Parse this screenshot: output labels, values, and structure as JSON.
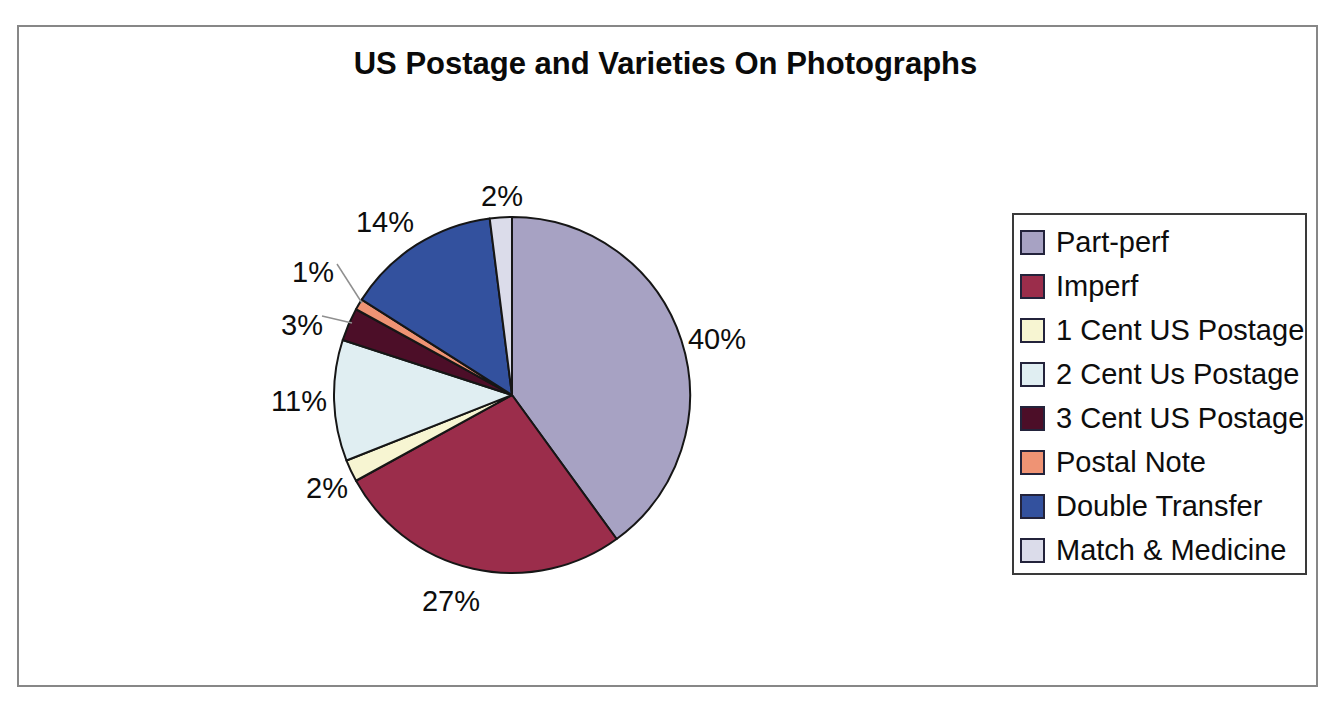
{
  "chart_data": {
    "type": "pie",
    "title": "US Postage and Varieties On Photographs",
    "legend_position": "right",
    "start_angle_deg": 0,
    "direction": "clockwise",
    "value_suffix": "%",
    "slices": [
      {
        "label": "Part-perf",
        "value": 40,
        "percent_label": "40%",
        "color": "#A7A2C3"
      },
      {
        "label": "Imperf",
        "value": 27,
        "percent_label": "27%",
        "color": "#9B2D4B"
      },
      {
        "label": "1 Cent US Postage",
        "value": 2,
        "percent_label": "2%",
        "color": "#F7F5D2"
      },
      {
        "label": "2 Cent Us Postage",
        "value": 11,
        "percent_label": "11%",
        "color": "#E0EEF2"
      },
      {
        "label": "3 Cent US Postage",
        "value": 3,
        "percent_label": "3%",
        "color": "#4C0E28"
      },
      {
        "label": "Postal Note",
        "value": 1,
        "percent_label": "1%",
        "color": "#EF9374"
      },
      {
        "label": "Double Transfer",
        "value": 14,
        "percent_label": "14%",
        "color": "#33519E"
      },
      {
        "label": "Match & Medicine",
        "value": 2,
        "percent_label": "2%",
        "color": "#DBDCEA"
      }
    ]
  }
}
